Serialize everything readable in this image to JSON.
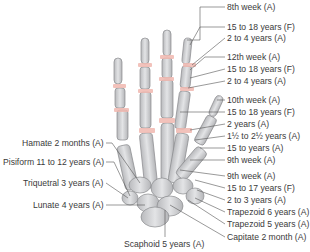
{
  "diagram": {
    "right_labels": [
      {
        "text": "8th week (A)",
        "x": 227,
        "y": 2
      },
      {
        "text": "15 to 18 years (F)",
        "x": 227,
        "y": 22
      },
      {
        "text": "2 to 4 years (A)",
        "x": 227,
        "y": 33
      },
      {
        "text": "12th week (A)",
        "x": 227,
        "y": 52
      },
      {
        "text": "15 to 18 years (F)",
        "x": 227,
        "y": 64
      },
      {
        "text": "2 to 4 years (A)",
        "x": 227,
        "y": 76
      },
      {
        "text": "10th week (A)",
        "x": 227,
        "y": 95
      },
      {
        "text": "15 to 18 years (F)",
        "x": 227,
        "y": 107
      },
      {
        "text": "2 years (A)",
        "x": 227,
        "y": 119
      },
      {
        "text": "1½ to 2½ years (A)",
        "x": 227,
        "y": 131
      },
      {
        "text": "15 to years (A)",
        "x": 227,
        "y": 143
      },
      {
        "text": "9th week (A)",
        "x": 227,
        "y": 155
      },
      {
        "text": "9th week (A)",
        "x": 227,
        "y": 171
      },
      {
        "text": "15 to 17 years (F)",
        "x": 227,
        "y": 183
      },
      {
        "text": "2 to 3 years (A)",
        "x": 227,
        "y": 195
      },
      {
        "text": "Trapezoid 6 years (A)",
        "x": 227,
        "y": 207
      },
      {
        "text": "Trapezoid 5 years (A)",
        "x": 227,
        "y": 219
      },
      {
        "text": "Capitate 2 month (A)",
        "x": 227,
        "y": 232
      }
    ],
    "left_labels": [
      {
        "text": "Hamate 2 months (A)",
        "x": 22,
        "y": 138
      },
      {
        "text": "Pisiform 11 to 12 years (A)",
        "x": 3,
        "y": 157
      },
      {
        "text": "Triquetral 3 years (A)",
        "x": 23,
        "y": 178
      },
      {
        "text": "Lunate 4 years (A)",
        "x": 33,
        "y": 200
      }
    ],
    "bottom_labels": [
      {
        "text": "Scaphoid 5 years (A)",
        "x": 124,
        "y": 239
      }
    ],
    "colors": {
      "bone_fill": "#d3d4d6",
      "bone_stroke": "#8a8b8e",
      "growth_plate": "#f0b8b0",
      "leader_line": "#555555",
      "text": "#3a3a3a"
    }
  }
}
